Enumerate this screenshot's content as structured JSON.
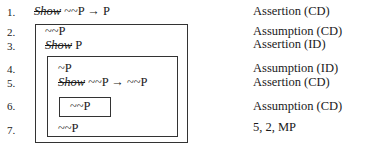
{
  "proof": {
    "lines": [
      {
        "num": "1.",
        "show": "Show",
        "formula": "~~P → P",
        "justification": "Assertion (CD)"
      },
      {
        "num": "2.",
        "show": "",
        "formula": "~~P",
        "justification": "Assumption (CD)"
      },
      {
        "num": "3.",
        "show": "Show",
        "formula": "P",
        "justification": "Assertion (ID)"
      },
      {
        "num": "4.",
        "show": "",
        "formula": "~P",
        "justification": "Assumption (ID)"
      },
      {
        "num": "5.",
        "show": "Show",
        "formula": "~~P → ~~P",
        "justification": "Assertion (CD)"
      },
      {
        "num": "6.",
        "show": "",
        "formula": "~~P",
        "justification": "Assumption (CD)"
      },
      {
        "num": "7.",
        "show": "",
        "formula": "~~P",
        "justification": "5, 2, MP"
      }
    ]
  }
}
